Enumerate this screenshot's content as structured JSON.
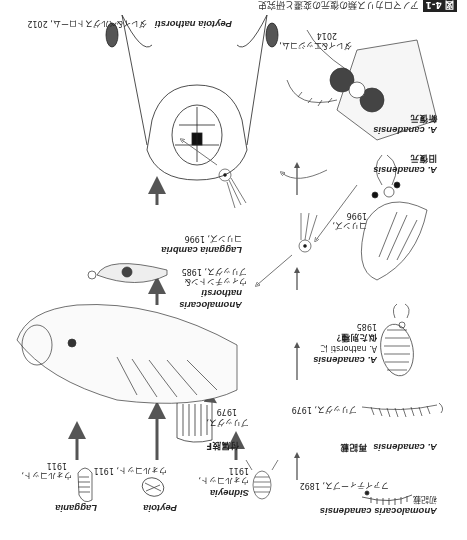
{
  "figure": {
    "badge": "図 4-1",
    "caption": "アノマロカリス類の復元の変遷と研究史"
  },
  "row_top": {
    "canadensis_first": {
      "name": "Anomalocaris canadensis",
      "note": "初記載",
      "author": "ファイティーブス, 1892"
    },
    "sidneyia": {
      "name": "Sidneyia",
      "author": "ウォルコット,",
      "year": "1911"
    },
    "peytoia": {
      "name": "Peytoia",
      "author": "ウォルコット, 1911"
    },
    "laggania": {
      "name": "Laggania",
      "author": "ウォルコット,",
      "year": "1911"
    }
  },
  "right_column": [
    {
      "name": "A. canadensis",
      "note": "再記載",
      "author": "ブリッグス, 1979"
    },
    {
      "name": "A. canadensis",
      "note1": "A. nathorsti に",
      "note2": "似た別種？",
      "year": "1985"
    },
    {
      "name": "A. canadensis",
      "note": "旧復元",
      "author": "コリンズ,",
      "year": "1996"
    },
    {
      "name": "A. canadensis",
      "note": "新復元",
      "author": "ダレイ&エッジコム,",
      "year": "2014"
    }
  ],
  "middle": {
    "appendage_f": {
      "label": "付属肢F",
      "author": "ブリッグス,",
      "year": "1979"
    },
    "nathorsti": {
      "name1": "Anomalocaris",
      "name2": "nathorsti",
      "author1": "ウィッチントン&",
      "author2": "ブリッグス, 1985"
    },
    "laggania_cambria": {
      "name": "Laggania cambria",
      "author": "コリンズ, 1996"
    },
    "peytoia_nathorsti": {
      "name": "Peytoia nathorsti",
      "author": "ダレイ&ベルグストローム, 2012"
    }
  }
}
